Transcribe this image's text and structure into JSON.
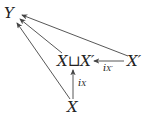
{
  "diagram": {
    "type": "commutative-diagram",
    "nodes": {
      "Y": "Y",
      "coproduct": "X⊔X′",
      "X_prime": "X′",
      "X": "X"
    },
    "arrows": [
      {
        "from": "X",
        "to": "coproduct",
        "label_main": "i",
        "label_sub": "X"
      },
      {
        "from": "X_prime",
        "to": "coproduct",
        "label_main": "i",
        "label_sub": "X′"
      },
      {
        "from": "X",
        "to": "Y",
        "label_main": "",
        "label_sub": ""
      },
      {
        "from": "coproduct",
        "to": "Y",
        "label_main": "",
        "label_sub": ""
      },
      {
        "from": "X_prime",
        "to": "Y",
        "label_main": "",
        "label_sub": ""
      }
    ],
    "line_color": "#444444"
  }
}
